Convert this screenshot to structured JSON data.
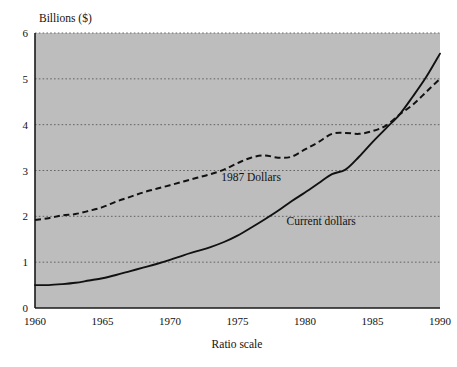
{
  "chart_data": {
    "type": "line",
    "title": "",
    "ylabel": "Billions ($)",
    "xlabel": "Ratio scale",
    "xlim": [
      1960,
      1990
    ],
    "ylim": [
      0,
      6
    ],
    "grid": true,
    "grid_axis": "y",
    "legend_position": "inline-annotations",
    "yticks": [
      "0",
      "1",
      "2",
      "3",
      "4",
      "5",
      "6"
    ],
    "ytick_values": [
      0,
      1,
      2,
      3,
      4,
      5,
      6
    ],
    "xticks": [
      "1960",
      "1965",
      "1970",
      "1975",
      "1980",
      "1985",
      "1990"
    ],
    "xtick_values": [
      1960,
      1965,
      1970,
      1975,
      1980,
      1985,
      1990
    ],
    "x": [
      1960,
      1961,
      1962,
      1963,
      1964,
      1965,
      1966,
      1967,
      1968,
      1969,
      1970,
      1971,
      1972,
      1973,
      1974,
      1975,
      1976,
      1977,
      1978,
      1979,
      1980,
      1981,
      1982,
      1983,
      1984,
      1985,
      1986,
      1987,
      1988,
      1989,
      1990
    ],
    "series": [
      {
        "name": "Current dollars",
        "style": "solid",
        "color": "#111111",
        "label_text": "Current dollars",
        "values": [
          0.5,
          0.5,
          0.52,
          0.55,
          0.6,
          0.65,
          0.72,
          0.8,
          0.88,
          0.96,
          1.05,
          1.15,
          1.24,
          1.33,
          1.44,
          1.58,
          1.75,
          1.93,
          2.12,
          2.33,
          2.52,
          2.72,
          2.92,
          3.02,
          3.3,
          3.62,
          3.92,
          4.22,
          4.62,
          5.05,
          5.55
        ]
      },
      {
        "name": "1987 Dollars",
        "style": "dashed",
        "color": "#111111",
        "label_text": "1987 Dollars",
        "values": [
          1.92,
          1.96,
          2.02,
          2.05,
          2.12,
          2.2,
          2.32,
          2.42,
          2.52,
          2.6,
          2.68,
          2.76,
          2.84,
          2.92,
          3.02,
          3.16,
          3.28,
          3.33,
          3.28,
          3.3,
          3.46,
          3.62,
          3.8,
          3.82,
          3.8,
          3.86,
          3.98,
          4.22,
          4.44,
          4.72,
          5.0
        ]
      }
    ],
    "annotations": [
      {
        "text": "1987 Dollars",
        "x": 1976.0,
        "y": 2.78
      },
      {
        "text": "Current dollars",
        "x": 1981.2,
        "y": 1.82
      }
    ]
  },
  "colors": {
    "plot_background": "#bdbdbd",
    "page_background": "#ffffff",
    "axis": "#1a1a1a",
    "gridline": "#5a5a5a",
    "line": "#111111"
  }
}
